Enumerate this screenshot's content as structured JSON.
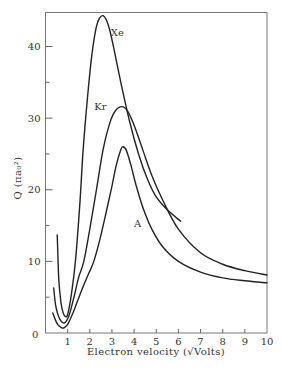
{
  "chart_data": {
    "type": "line",
    "title": "",
    "xlabel": "Electron velocity (√Volts)",
    "ylabel": "Q (πa₀²)",
    "xlim": [
      0,
      10
    ],
    "ylim": [
      0,
      45
    ],
    "grid": false,
    "legend": "inline labels on curves",
    "x_ticks": [
      "1",
      "2",
      "3",
      "4",
      "5",
      "6",
      "7",
      "8",
      "9",
      "10"
    ],
    "x_origin_label": "0",
    "y_ticks": [
      "10",
      "20",
      "30",
      "40"
    ],
    "y_minor_ticks": [
      5,
      15,
      25,
      35
    ],
    "series": [
      {
        "name": "Xe",
        "x": [
          0.53,
          0.6,
          0.7,
          0.8,
          0.9,
          1.0,
          1.15,
          1.35,
          1.55,
          1.7,
          1.9,
          2.1,
          2.3,
          2.45,
          2.6,
          2.75,
          2.9,
          3.1,
          3.4,
          3.8,
          4.2,
          4.6,
          5.0,
          5.5,
          6.1
        ],
        "values": [
          13.7,
          7.5,
          4.2,
          2.8,
          2.3,
          2.6,
          5.0,
          10.0,
          18.0,
          25.6,
          33.0,
          39.0,
          42.8,
          44.0,
          44.3,
          43.7,
          42.3,
          39.5,
          35.0,
          29.5,
          25.0,
          21.5,
          19.0,
          17.2,
          15.6
        ]
      },
      {
        "name": "Kr",
        "x": [
          0.37,
          0.45,
          0.55,
          0.65,
          0.75,
          0.85,
          0.95,
          1.1,
          1.3,
          1.5,
          1.73,
          2.0,
          2.3,
          2.6,
          2.9,
          3.15,
          3.45,
          3.7,
          4.0,
          4.4,
          4.8,
          5.3,
          6.0,
          7.0,
          8.0,
          9.0,
          10.0
        ],
        "values": [
          6.3,
          4.0,
          2.7,
          1.9,
          1.5,
          1.4,
          1.7,
          2.8,
          5.2,
          7.8,
          10.0,
          14.5,
          20.0,
          25.6,
          29.3,
          31.0,
          31.6,
          31.0,
          29.0,
          25.5,
          22.0,
          18.5,
          14.5,
          11.2,
          9.6,
          8.7,
          8.1
        ]
      },
      {
        "name": "A",
        "x": [
          0.33,
          0.45,
          0.55,
          0.65,
          0.75,
          0.85,
          1.0,
          1.2,
          1.45,
          1.7,
          1.95,
          2.18,
          2.45,
          2.75,
          3.0,
          3.2,
          3.4,
          3.5,
          3.65,
          3.85,
          4.1,
          4.4,
          4.8,
          5.3,
          6.0,
          7.0,
          8.0,
          9.0,
          10.0
        ],
        "values": [
          2.8,
          1.8,
          1.2,
          0.9,
          0.7,
          0.75,
          1.2,
          2.5,
          4.5,
          6.5,
          8.3,
          10.0,
          13.0,
          17.0,
          20.5,
          23.5,
          25.6,
          26.0,
          25.5,
          23.5,
          20.5,
          17.5,
          14.5,
          12.0,
          10.0,
          8.5,
          7.7,
          7.3,
          7.0
        ]
      }
    ],
    "annotations": [
      {
        "text": "Xe",
        "x": 2.95,
        "y": 41.5
      },
      {
        "text": "Kr",
        "x": 2.2,
        "y": 31.2
      },
      {
        "text": "A",
        "x": 4.0,
        "y": 14.8
      }
    ]
  },
  "labels": {
    "xe": "Xe",
    "kr": "Kr",
    "a": "A",
    "origin": "0",
    "xlabel": "Electron velocity (√Volts)",
    "ylabel": "Q (πa₀²)"
  }
}
